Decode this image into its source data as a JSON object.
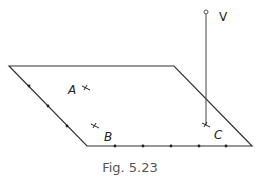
{
  "figure": {
    "caption": "Fig. 5.23",
    "plane": {
      "vertices": [
        [
          9,
          66
        ],
        [
          174,
          66
        ],
        [
          252,
          146
        ],
        [
          87,
          146
        ]
      ],
      "stroke": "#333333"
    },
    "left_edge_dots": [
      [
        29,
        86
      ],
      [
        48,
        106
      ],
      [
        67,
        126
      ]
    ],
    "bottom_edge_dots": [
      [
        115,
        146
      ],
      [
        143,
        146
      ],
      [
        171,
        146
      ],
      [
        199,
        146
      ],
      [
        226,
        146
      ]
    ],
    "vertical": {
      "label": "V",
      "x": 206,
      "y_top": 12,
      "y_bottom": 125,
      "label_pos": [
        219,
        21
      ]
    },
    "points": [
      {
        "label": "A",
        "label_pos": [
          68,
          94
        ],
        "mark": [
          86,
          88
        ]
      },
      {
        "label": "B",
        "label_pos": [
          104,
          141
        ],
        "mark": [
          95,
          126
        ]
      },
      {
        "label": "C",
        "label_pos": [
          214,
          139
        ],
        "mark": [
          206,
          125
        ]
      }
    ]
  }
}
